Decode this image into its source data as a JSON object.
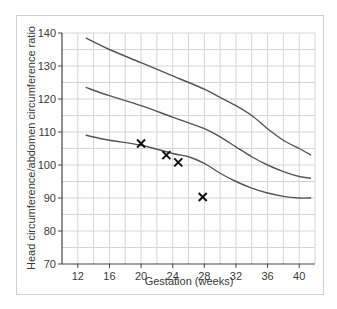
{
  "chart_data": {
    "type": "line",
    "title": "",
    "xlabel": "Gestation (weeks)",
    "ylabel": "Head circumference/abdomen circumference ratio",
    "xlim": [
      10,
      42
    ],
    "ylim": [
      70,
      140
    ],
    "x_ticks": [
      12,
      16,
      20,
      24,
      28,
      32,
      36,
      40
    ],
    "y_ticks": [
      70,
      80,
      90,
      100,
      110,
      120,
      130,
      140
    ],
    "grid": true,
    "legend": null,
    "series": [
      {
        "name": "upper reference curve",
        "x": [
          13,
          16,
          20,
          24,
          28,
          30,
          32,
          34,
          36,
          38,
          40,
          41.5
        ],
        "values": [
          138.5,
          135,
          131,
          127,
          123,
          120.5,
          118,
          115,
          111,
          107.5,
          105,
          103
        ]
      },
      {
        "name": "mean reference curve",
        "x": [
          13,
          16,
          20,
          24,
          28,
          30,
          32,
          34,
          36,
          38,
          40,
          41.5
        ],
        "values": [
          123.5,
          121,
          118,
          114.5,
          111,
          108.5,
          105.5,
          102.5,
          100,
          98,
          96.5,
          96
        ]
      },
      {
        "name": "lower reference curve",
        "x": [
          13,
          16,
          20,
          24,
          26,
          28,
          30,
          32,
          34,
          36,
          38,
          40,
          41.5
        ],
        "values": [
          109,
          107.5,
          106,
          103.5,
          102.5,
          100.5,
          97.5,
          95,
          93,
          91.5,
          90.5,
          90,
          90
        ]
      }
    ],
    "points": {
      "name": "measurements",
      "marker": "x",
      "x": [
        20,
        23.2,
        24.7,
        27.8
      ],
      "values": [
        106.5,
        103,
        100.8,
        90.3
      ]
    }
  },
  "colors": {
    "curve": "#555555",
    "marker": "#111111",
    "grid": "#d4d4d4",
    "axis": "#444444",
    "frame": "#cfcfcf"
  }
}
